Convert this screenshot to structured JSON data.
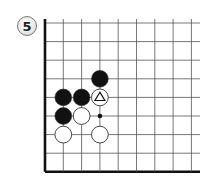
{
  "diagram": {
    "label": "5",
    "board": {
      "origin_x": 45,
      "origin_y": 23,
      "spacing_x": 18.3,
      "spacing_y": 18.6,
      "cols": 9,
      "rows": 9,
      "right_extent": 200,
      "top_extent": 19,
      "edges": [
        "left",
        "bottom"
      ]
    },
    "stones": [
      {
        "color": "black",
        "col": 3,
        "row": 3
      },
      {
        "color": "black",
        "col": 1,
        "row": 4
      },
      {
        "color": "black",
        "col": 2,
        "row": 4
      },
      {
        "color": "white",
        "col": 3,
        "row": 4,
        "mark": "triangle"
      },
      {
        "color": "black",
        "col": 1,
        "row": 5
      },
      {
        "color": "white",
        "col": 2,
        "row": 5
      },
      {
        "color": "white",
        "col": 1,
        "row": 6
      },
      {
        "color": "white",
        "col": 3,
        "row": 6
      }
    ],
    "markers": [
      {
        "type": "dot",
        "col": 3,
        "row": 5
      }
    ],
    "colors": {
      "line": "#555555",
      "edge": "#111111",
      "black_stone": "#111111",
      "white_stone": "#ffffff",
      "stone_outline": "#333333"
    }
  }
}
